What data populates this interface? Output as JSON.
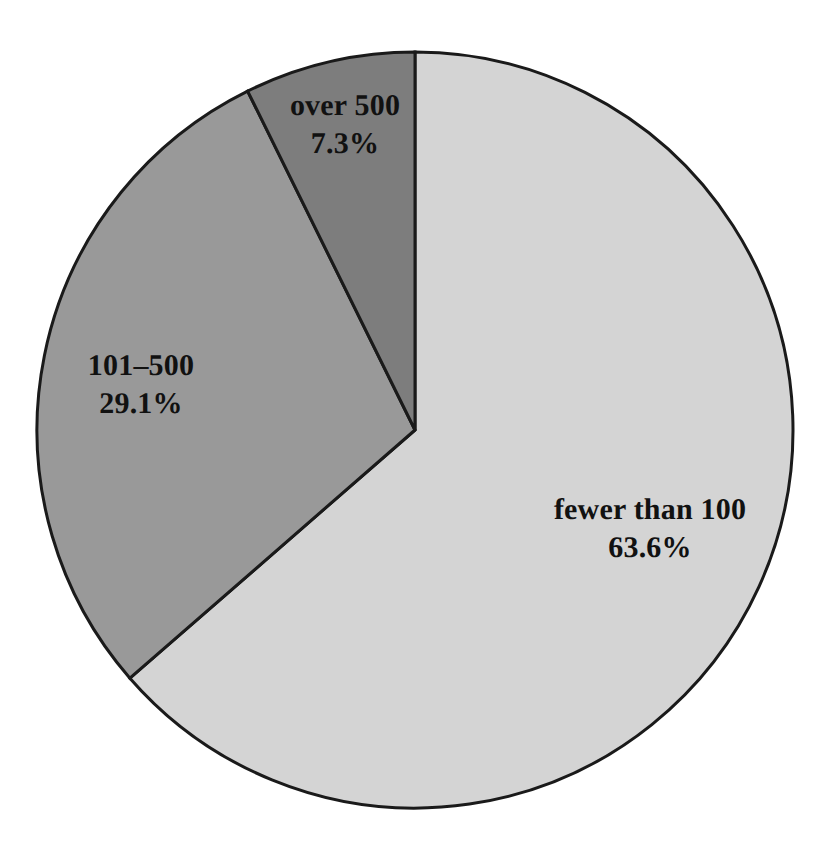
{
  "chart_data": {
    "type": "pie",
    "title": "",
    "subtitle": "",
    "xlabel": "",
    "ylabel": "",
    "legend_position": "none",
    "grid": false,
    "labels_inside_slices": true,
    "start_angle_deg": 0,
    "direction": "clockwise",
    "categories": [
      "fewer than 100",
      "101–500",
      "over 500"
    ],
    "values": [
      63.6,
      29.1,
      7.3
    ],
    "value_unit": "percent",
    "slices": [
      {
        "label": "fewer than 100",
        "percent_text": "63.6%",
        "value": 63.6,
        "color": "#d4d4d4",
        "start_angle_deg": 0,
        "end_angle_deg": 228.96,
        "label_x": 650,
        "label_y": 528
      },
      {
        "label": "101–500",
        "percent_text": "29.1%",
        "value": 29.1,
        "color": "#999999",
        "start_angle_deg": 228.96,
        "end_angle_deg": 333.72,
        "label_x": 141,
        "label_y": 384
      },
      {
        "label": "over 500",
        "percent_text": "7.3%",
        "value": 7.3,
        "color": "#7d7d7d",
        "start_angle_deg": 333.72,
        "end_angle_deg": 360,
        "label_x": 345,
        "label_y": 124
      }
    ],
    "geometry": {
      "center_x": 415,
      "center_y": 430,
      "radius": 378,
      "outline_color": "#1a1a1a",
      "outline_width": 3,
      "background": "#ffffff"
    }
  }
}
